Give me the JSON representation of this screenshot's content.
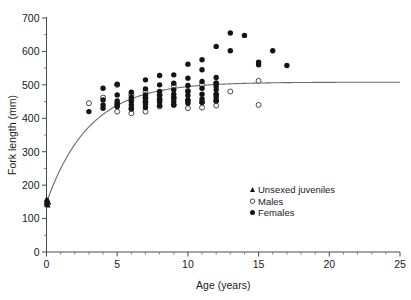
{
  "chart_data": {
    "type": "scatter",
    "title": "",
    "xlabel": "Age (years)",
    "ylabel": "Fork length (mm)",
    "xlim": [
      0,
      25
    ],
    "ylim": [
      0,
      700
    ],
    "xticks": [
      0,
      5,
      10,
      15,
      20,
      25
    ],
    "yticks": [
      0,
      100,
      200,
      300,
      400,
      500,
      600,
      700
    ],
    "xtick_labels": [
      "0",
      "5",
      "10",
      "15",
      "20",
      "25"
    ],
    "ytick_labels": [
      "0",
      "100",
      "200",
      "300",
      "400",
      "500",
      "600",
      "700"
    ],
    "x_minor_tick_interval": 1,
    "y_minor_tick_interval": 50,
    "grid": false,
    "legend_position": "lower-right-inside",
    "spines": [
      "left",
      "bottom"
    ],
    "series": [
      {
        "name": "Unsexed juveniles",
        "marker": "triangle-filled",
        "color": "#141414",
        "points": [
          [
            0.0,
            158
          ],
          [
            0.0,
            152
          ],
          [
            0.0,
            147
          ],
          [
            0.0,
            142
          ],
          [
            0.05,
            150
          ],
          [
            0.05,
            144
          ],
          [
            0.1,
            155
          ],
          [
            0.1,
            140
          ],
          [
            0.15,
            148
          ]
        ]
      },
      {
        "name": "Males",
        "marker": "circle-open",
        "color": "#ffffff",
        "edge_color": "#333333",
        "points": [
          [
            3.0,
            445
          ],
          [
            4.0,
            462
          ],
          [
            5.0,
            500
          ],
          [
            5.0,
            440
          ],
          [
            5.0,
            420
          ],
          [
            6.0,
            470
          ],
          [
            6.0,
            455
          ],
          [
            6.0,
            430
          ],
          [
            6.0,
            415
          ],
          [
            7.0,
            478
          ],
          [
            7.0,
            462
          ],
          [
            7.0,
            448
          ],
          [
            7.0,
            420
          ],
          [
            8.0,
            470
          ],
          [
            8.0,
            455
          ],
          [
            8.0,
            435
          ],
          [
            9.0,
            497
          ],
          [
            9.0,
            460
          ],
          [
            9.0,
            440
          ],
          [
            10.0,
            482
          ],
          [
            10.0,
            452
          ],
          [
            10.0,
            430
          ],
          [
            11.0,
            500
          ],
          [
            11.0,
            448
          ],
          [
            11.0,
            432
          ],
          [
            12.0,
            505
          ],
          [
            12.0,
            470
          ],
          [
            12.0,
            452
          ],
          [
            12.0,
            438
          ],
          [
            13.0,
            480
          ],
          [
            15.0,
            512
          ],
          [
            15.0,
            440
          ]
        ]
      },
      {
        "name": "Females",
        "marker": "circle-filled",
        "color": "#141414",
        "points": [
          [
            3.0,
            420
          ],
          [
            4.0,
            490
          ],
          [
            4.0,
            455
          ],
          [
            4.0,
            440
          ],
          [
            4.0,
            430
          ],
          [
            5.0,
            502
          ],
          [
            5.0,
            470
          ],
          [
            5.0,
            452
          ],
          [
            5.0,
            445
          ],
          [
            5.0,
            435
          ],
          [
            6.0,
            478
          ],
          [
            6.0,
            462
          ],
          [
            6.0,
            450
          ],
          [
            6.0,
            440
          ],
          [
            6.0,
            428
          ],
          [
            7.0,
            515
          ],
          [
            7.0,
            488
          ],
          [
            7.0,
            470
          ],
          [
            7.0,
            460
          ],
          [
            7.0,
            452
          ],
          [
            7.0,
            442
          ],
          [
            7.0,
            432
          ],
          [
            8.0,
            528
          ],
          [
            8.0,
            500
          ],
          [
            8.0,
            480
          ],
          [
            8.0,
            468
          ],
          [
            8.0,
            458
          ],
          [
            8.0,
            448
          ],
          [
            8.0,
            438
          ],
          [
            9.0,
            530
          ],
          [
            9.0,
            505
          ],
          [
            9.0,
            485
          ],
          [
            9.0,
            472
          ],
          [
            9.0,
            462
          ],
          [
            9.0,
            450
          ],
          [
            9.0,
            440
          ],
          [
            10.0,
            562
          ],
          [
            10.0,
            520
          ],
          [
            10.0,
            498
          ],
          [
            10.0,
            480
          ],
          [
            10.0,
            468
          ],
          [
            10.0,
            455
          ],
          [
            10.0,
            445
          ],
          [
            11.0,
            575
          ],
          [
            11.0,
            545
          ],
          [
            11.0,
            510
          ],
          [
            11.0,
            490
          ],
          [
            11.0,
            472
          ],
          [
            11.0,
            458
          ],
          [
            11.0,
            448
          ],
          [
            12.0,
            615
          ],
          [
            12.0,
            522
          ],
          [
            12.0,
            505
          ],
          [
            12.0,
            495
          ],
          [
            12.0,
            485
          ],
          [
            12.0,
            472
          ],
          [
            12.0,
            462
          ],
          [
            12.0,
            452
          ],
          [
            13.0,
            655
          ],
          [
            13.0,
            602
          ],
          [
            14.0,
            648
          ],
          [
            15.0,
            568
          ],
          [
            15.0,
            560
          ],
          [
            16.0,
            602
          ],
          [
            17.0,
            558
          ]
        ]
      }
    ],
    "fit_curve": {
      "name": "von Bertalanffy growth curve",
      "color": "#6b6b6b",
      "asymptote_mm": 508,
      "length_at_age_zero_mm": 148,
      "growth_coefficient_k": 0.33,
      "x_range": [
        0,
        25
      ]
    },
    "legend": [
      {
        "label": "Unsexed juveniles",
        "marker": "triangle-filled"
      },
      {
        "label": "Males",
        "marker": "circle-open"
      },
      {
        "label": "Females",
        "marker": "circle-filled"
      }
    ]
  }
}
